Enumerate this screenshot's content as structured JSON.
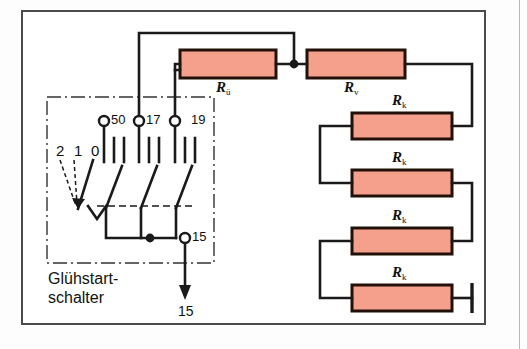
{
  "diagram": {
    "title_caption": "Glühstart-\nschalter",
    "caption_line1": "Glühstart-",
    "caption_line2": "schalter",
    "colors": {
      "resistor_fill": "#f4a08d",
      "resistor_stroke": "#221108",
      "wire": "#1a1a1a",
      "frame": "#4a4a4a",
      "dashdot": "#333333",
      "background": "#ffffff"
    },
    "switch_box": {
      "name": "Glühstartschalter",
      "positions": [
        {
          "label": "2",
          "name": "switch-position-2"
        },
        {
          "label": "1",
          "name": "switch-position-1"
        },
        {
          "label": "0",
          "name": "switch-position-0"
        }
      ],
      "terminals": [
        {
          "label": "50",
          "name": "terminal-50"
        },
        {
          "label": "17",
          "name": "terminal-17"
        },
        {
          "label": "19",
          "name": "terminal-19"
        },
        {
          "label": "15",
          "name": "terminal-15"
        }
      ]
    },
    "output_arrow": {
      "label": "15",
      "name": "supply-terminal-15"
    },
    "resistors": [
      {
        "label": "R",
        "sub": "ü",
        "name": "resistor-Ru"
      },
      {
        "label": "R",
        "sub": "v",
        "name": "resistor-Rv"
      },
      {
        "label": "R",
        "sub": "k",
        "name": "resistor-Rk-1"
      },
      {
        "label": "R",
        "sub": "k",
        "name": "resistor-Rk-2"
      },
      {
        "label": "R",
        "sub": "k",
        "name": "resistor-Rk-3"
      },
      {
        "label": "R",
        "sub": "k",
        "name": "resistor-Rk-4"
      }
    ],
    "ground": {
      "name": "chassis-ground"
    }
  }
}
